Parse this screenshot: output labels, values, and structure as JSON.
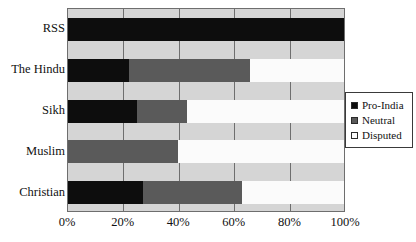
{
  "chart_data": {
    "type": "bar",
    "orientation": "horizontal",
    "stacked": true,
    "stack_mode": "percent",
    "title": "",
    "xlabel": "",
    "ylabel": "",
    "xlim": [
      0,
      100
    ],
    "xticks": [
      0,
      20,
      40,
      60,
      80,
      100
    ],
    "xtick_labels": [
      "0%",
      "20%",
      "40%",
      "60%",
      "80%",
      "100%"
    ],
    "grid": true,
    "grid_axis": "x",
    "legend_position": "right",
    "categories": [
      "RSS",
      "The Hindu",
      "Sikh",
      "Muslim",
      "Christian"
    ],
    "series": [
      {
        "name": "Pro-India",
        "color": "#0d0d0d",
        "values": [
          100,
          22,
          25,
          0,
          27
        ]
      },
      {
        "name": "Neutral",
        "color": "#5a5a5a",
        "values": [
          0,
          44,
          18,
          40,
          36
        ]
      },
      {
        "name": "Disputed",
        "color": "#fbfbfb",
        "values": [
          0,
          34,
          57,
          60,
          37
        ]
      }
    ]
  },
  "colors": {
    "plot_background": "#d5d5d5",
    "gridline": "#6e6e6e",
    "axis_border": "#6e6e6e",
    "text": "#111111",
    "legend_border": "#3a3a3a",
    "page_background": "#ffffff"
  }
}
